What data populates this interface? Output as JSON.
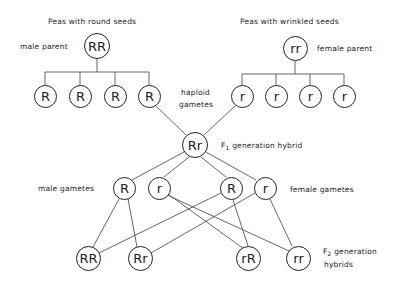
{
  "labels": {
    "round_title": "Peas with round seeds",
    "wrinkled_title": "Peas with wrinkled seeds",
    "male_parent": "male parent",
    "female_parent": "female parent",
    "haploid": "haploid",
    "gametes": "gametes",
    "f1_prefix": "F",
    "f1_sub": "1",
    "f1_suffix": " generation hybrid",
    "male_gametes": "male gametes",
    "female_gametes": "female gametes",
    "f2_prefix": "F",
    "f2_sub": "2",
    "f2_suffix": " generation",
    "f2_line2": "hybrids"
  },
  "nodes": {
    "male_parent": "RR",
    "female_parent": "rr",
    "male_haploid": [
      "R",
      "R",
      "R",
      "R"
    ],
    "female_haploid": [
      "r",
      "r",
      "r",
      "r"
    ],
    "f1": "Rr",
    "f1_gametes": [
      "R",
      "r",
      "R",
      "r"
    ],
    "f2": [
      "RR",
      "Rr",
      "rR",
      "rr"
    ]
  },
  "colors": {
    "line": "#555555",
    "ink": "#222222",
    "background": "#ffffff"
  }
}
